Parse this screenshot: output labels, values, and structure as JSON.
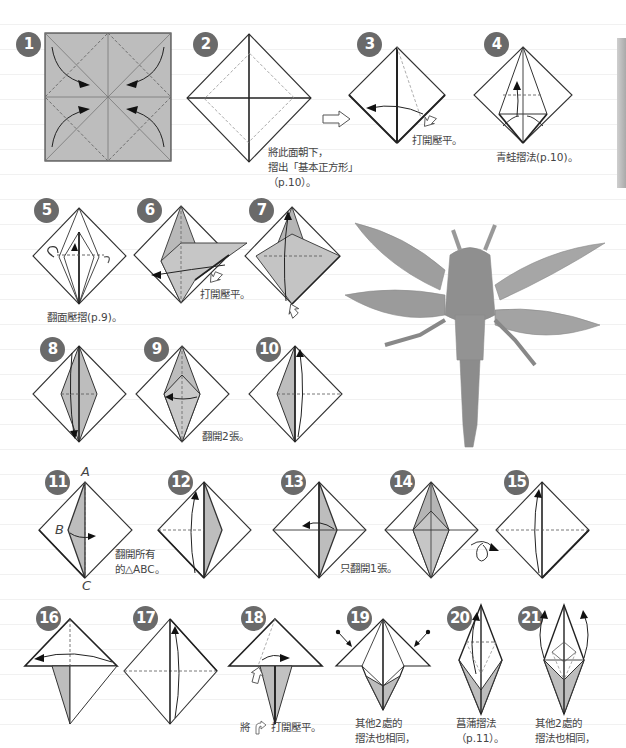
{
  "page": {
    "type": "origami-instruction-page"
  },
  "colors": {
    "paper_gray": "#bdbdbd",
    "badge": "#6a6a6a",
    "line": "#333333",
    "text": "#444444"
  },
  "steps": [
    {
      "number": "1",
      "caption": ""
    },
    {
      "number": "2",
      "caption_lines": [
        "將此面朝下，",
        "摺出「基本正方形」",
        "（p.10）。"
      ]
    },
    {
      "number": "3",
      "caption": "打開壓平。"
    },
    {
      "number": "4",
      "caption": "青蛙摺法(p.10)。"
    },
    {
      "number": "5",
      "caption": "翻面壓摺(p.9)。"
    },
    {
      "number": "6",
      "caption": "打開壓平。"
    },
    {
      "number": "7",
      "caption": ""
    },
    {
      "number": "8",
      "caption": ""
    },
    {
      "number": "9",
      "caption": "翻開2張。"
    },
    {
      "number": "10",
      "caption": ""
    },
    {
      "number": "11",
      "caption_lines": [
        "翻開所有",
        "的△ABC。"
      ],
      "labels": {
        "a": "A",
        "b": "B",
        "c": "C"
      }
    },
    {
      "number": "12",
      "caption": ""
    },
    {
      "number": "13",
      "caption": "只翻開1張。"
    },
    {
      "number": "14",
      "caption": ""
    },
    {
      "number": "15",
      "caption": ""
    },
    {
      "number": "16",
      "caption": ""
    },
    {
      "number": "17",
      "caption": ""
    },
    {
      "number": "18",
      "caption_prefix": "將",
      "caption_suffix": "打開壓平。"
    },
    {
      "number": "19",
      "caption_lines": [
        "其他2處的",
        "摺法也相同，"
      ]
    },
    {
      "number": "20",
      "caption_lines": [
        "菖蒲摺法",
        "（p.11）。"
      ]
    },
    {
      "number": "21",
      "caption_lines": [
        "其他2處的",
        "摺法也相同，"
      ]
    }
  ],
  "photo": {
    "alt": "finished origami dragonfly"
  },
  "icons": {
    "next_arrow": "hollow-right-arrow",
    "turn_over": "loop-arrow-turn-over",
    "push": "hollow-push-arrow"
  }
}
